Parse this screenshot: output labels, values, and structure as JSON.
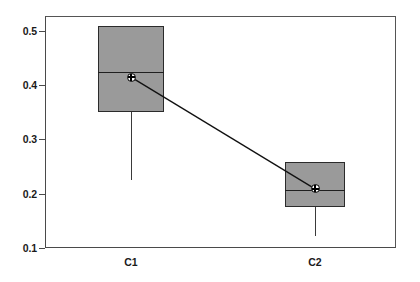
{
  "chart_data": {
    "type": "boxplot",
    "title": "",
    "xlabel": "",
    "ylabel": "",
    "categories": [
      "C1",
      "C2"
    ],
    "ylim": [
      0.1,
      0.52
    ],
    "yticks": [
      0.1,
      0.2,
      0.3,
      0.4,
      0.5
    ],
    "ytick_labels": [
      "0.1",
      "0.2",
      "0.3",
      "0.4",
      "0.5"
    ],
    "grid": false,
    "legend": null,
    "series": [
      {
        "name": "C1",
        "q3": 0.509,
        "median": 0.424,
        "q1": 0.351,
        "mean": 0.415,
        "whisker_low": 0.225,
        "whisker_high": 0.509
      },
      {
        "name": "C2",
        "q3": 0.259,
        "median": 0.207,
        "q1": 0.176,
        "mean": 0.209,
        "whisker_low": 0.122,
        "whisker_high": 0.259
      }
    ],
    "mean_connector": {
      "from": "C1",
      "to": "C2",
      "visible": true
    },
    "colors": {
      "box_fill": "#9a9a9a",
      "box_edge": "#2b2b2b",
      "median_line": "#1f1f1f",
      "whisker": "#3a3a3a",
      "axis": "#4a4a4a",
      "mean_marker": "#000000",
      "background": "#ffffff"
    }
  },
  "axes": {
    "y_ticks": [
      {
        "label": "0.5"
      },
      {
        "label": "0.4"
      },
      {
        "label": "0.3"
      },
      {
        "label": "0.2"
      },
      {
        "label": "0.1"
      }
    ],
    "x_ticks": [
      {
        "label": "C1"
      },
      {
        "label": "C2"
      }
    ]
  }
}
